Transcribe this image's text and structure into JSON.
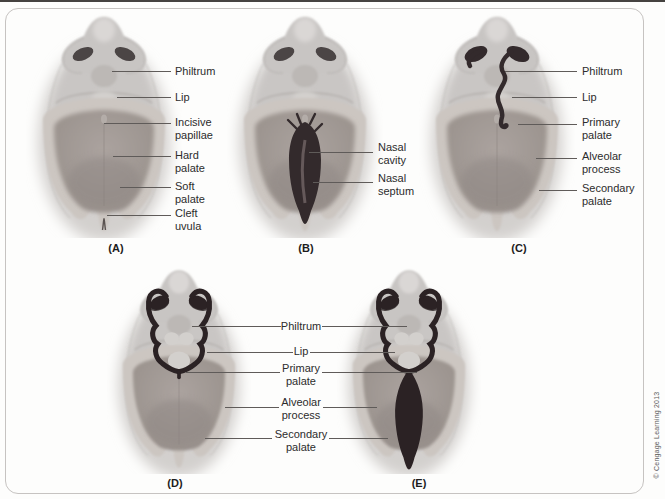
{
  "meta": {
    "credit": "© Cengage Learning 2013"
  },
  "panels": [
    {
      "letter": "(A)",
      "labels": [
        "Philtrum",
        "Lip",
        "Incisive papillae",
        "Hard palate",
        "Soft palate",
        "Cleft uvula"
      ]
    },
    {
      "letter": "(B)",
      "labels": [
        "Nasal cavity",
        "Nasal septum"
      ]
    },
    {
      "letter": "(C)",
      "labels": [
        "Philtrum",
        "Lip",
        "Primary palate",
        "Alveolar process",
        "Secondary palate"
      ]
    },
    {
      "letter": "(D)",
      "labels": []
    },
    {
      "letter": "(E)",
      "labels": []
    }
  ],
  "shared_labels": [
    "Philtrum",
    "Lip",
    "Primary palate",
    "Alveolar process",
    "Secondary palate"
  ],
  "colors": {
    "face_soft": "#d3d0ce",
    "face": "#c9c6c4",
    "nose": "#c8c5c3",
    "nose_highlight": "#dad7d5",
    "nostril": "#4b4545",
    "philtrum": "#bcb8b5",
    "lip_highlight": "#d3d0cd",
    "crease": "#b2aeab",
    "palate_ring": "#ccc6c1",
    "palate_inner_light": "#aba39f",
    "palate_inner": "#9c948f",
    "palate_inner_dark": "#8f8784",
    "cleft_dark": "#332a2c",
    "cleft_black": "#2b2224",
    "leader": "#5f5b59",
    "label_text": "#2c2c2c",
    "panel_letter": "#1c1c1c",
    "frame_border": "#c6c3c1",
    "top_rule": "#454240",
    "bottom_bar": "#36332f",
    "credit_text": "#5a5a5a"
  }
}
